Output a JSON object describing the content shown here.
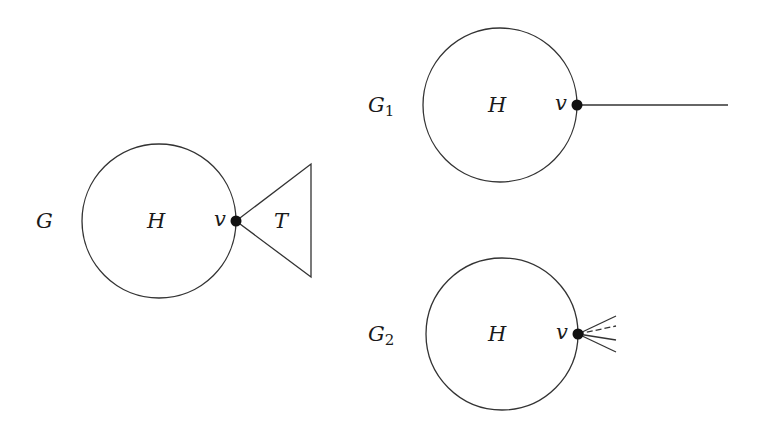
{
  "figure": {
    "graphs": [
      {
        "id": "G",
        "name": "G",
        "subscript": "",
        "subgraph_label": "H",
        "vertex_label": "v",
        "attachment": "triangle",
        "attachment_label": "T",
        "circle": {
          "cx": 159,
          "cy": 221,
          "r": 77
        },
        "vertex": {
          "x": 236,
          "y": 221
        }
      },
      {
        "id": "G1",
        "name": "G",
        "subscript": "1",
        "subgraph_label": "H",
        "vertex_label": "v",
        "attachment": "single-edge",
        "circle": {
          "cx": 500,
          "cy": 105,
          "r": 77
        },
        "vertex": {
          "x": 577,
          "y": 105
        }
      },
      {
        "id": "G2",
        "name": "G",
        "subscript": "2",
        "subgraph_label": "H",
        "vertex_label": "v",
        "attachment": "edge-fan",
        "edge_count": 4,
        "circle": {
          "cx": 502,
          "cy": 334,
          "r": 76
        },
        "vertex": {
          "x": 578,
          "y": 334
        }
      }
    ],
    "colors": {
      "stroke": "#333333",
      "vertex": "#111111",
      "text": "#1a1a1a",
      "background": "#ffffff"
    }
  }
}
